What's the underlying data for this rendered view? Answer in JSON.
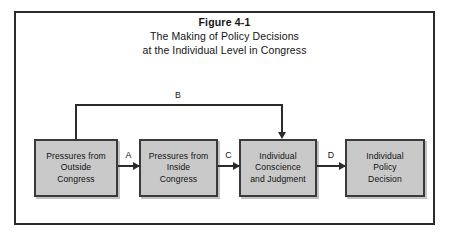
{
  "figure": {
    "title_bold": "Figure 4-1",
    "subtitle_line1": "The Making of Policy Decisions",
    "subtitle_line2": "at the Individual Level in Congress"
  },
  "colors": {
    "box_fill": "#c9c9c9",
    "box_border": "#3a3a3a",
    "frame_border": "#2b2b2b",
    "arrow": "#2b2b2b",
    "background": "#ffffff",
    "text": "#121212"
  },
  "chart_data": {
    "type": "diagram",
    "nodes": [
      {
        "id": "outside",
        "label": "Pressures from\nOutside\nCongress"
      },
      {
        "id": "inside",
        "label": "Pressures from\nInside\nCongress"
      },
      {
        "id": "conscience",
        "label": "Individual\nConscience\nand Judgment"
      },
      {
        "id": "decision",
        "label": "Individual\nPolicy\nDecision"
      }
    ],
    "edges": [
      {
        "id": "A",
        "label": "A",
        "from": "outside",
        "to": "inside",
        "direction": "right"
      },
      {
        "id": "B",
        "label": "B",
        "from": "outside",
        "to": "conscience",
        "direction": "over-top"
      },
      {
        "id": "C",
        "label": "C",
        "from": "inside",
        "to": "conscience",
        "direction": "right"
      },
      {
        "id": "D",
        "label": "D",
        "from": "conscience",
        "to": "decision",
        "direction": "right"
      }
    ]
  },
  "boxes": {
    "outside": "Pressures from\nOutside\nCongress",
    "inside": "Pressures from\nInside\nCongress",
    "conscience": "Individual\nConscience\nand Judgment",
    "decision": "Individual\nPolicy\nDecision"
  },
  "labels": {
    "a": "A",
    "b": "B",
    "c": "C",
    "d": "D"
  }
}
